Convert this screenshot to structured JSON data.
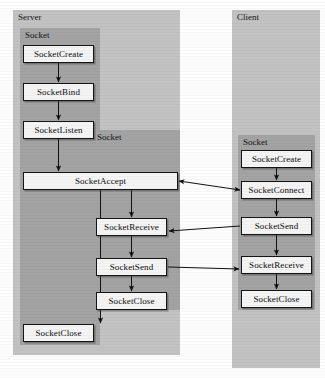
{
  "diagram": {
    "colors": {
      "outer_panel": "#c2c2c2",
      "inner_panel": "#a3a3a3",
      "node_fill": "#f4f4f4",
      "node_border": "#151515",
      "background": "#fdfdfd"
    },
    "panels": [
      {
        "id": "server",
        "label": "Server",
        "x": 13,
        "y": 10,
        "w": 167,
        "h": 345,
        "kind": "outer"
      },
      {
        "id": "server-socket-1",
        "label": "Socket",
        "x": 20,
        "y": 28,
        "w": 80,
        "h": 317,
        "kind": "inner"
      },
      {
        "id": "server-socket-2",
        "label": "Socket",
        "x": 92,
        "y": 130,
        "w": 88,
        "h": 180,
        "kind": "inner"
      },
      {
        "id": "client",
        "label": "Client",
        "x": 232,
        "y": 10,
        "w": 88,
        "h": 358,
        "kind": "outer"
      },
      {
        "id": "client-socket",
        "label": "Socket",
        "x": 238,
        "y": 135,
        "w": 77,
        "h": 175,
        "kind": "inner"
      }
    ],
    "nodes": [
      {
        "id": "srv-create",
        "label": "SocketCreate",
        "x": 23,
        "y": 45,
        "w": 71,
        "group": "server-socket-1"
      },
      {
        "id": "srv-bind",
        "label": "SocketBind",
        "x": 23,
        "y": 83,
        "w": 71,
        "group": "server-socket-1"
      },
      {
        "id": "srv-listen",
        "label": "SocketListen",
        "x": 23,
        "y": 121,
        "w": 71,
        "group": "server-socket-1"
      },
      {
        "id": "srv-accept",
        "label": "SocketAccept",
        "x": 23,
        "y": 172,
        "w": 155,
        "group": "server"
      },
      {
        "id": "srv-receive",
        "label": "SocketReceive",
        "x": 96,
        "y": 218,
        "w": 71,
        "group": "server-socket-2"
      },
      {
        "id": "srv-send",
        "label": "SocketSend",
        "x": 96,
        "y": 258,
        "w": 71,
        "group": "server-socket-2"
      },
      {
        "id": "srv-close-2",
        "label": "SocketClose",
        "x": 96,
        "y": 292,
        "w": 71,
        "group": "server-socket-2"
      },
      {
        "id": "srv-close-1",
        "label": "SocketClose",
        "x": 23,
        "y": 324,
        "w": 71,
        "group": "server-socket-1"
      },
      {
        "id": "cli-create",
        "label": "SocketCreate",
        "x": 241,
        "y": 150,
        "w": 71,
        "group": "client-socket"
      },
      {
        "id": "cli-connect",
        "label": "SocketConnect",
        "x": 241,
        "y": 181,
        "w": 71,
        "group": "client-socket"
      },
      {
        "id": "cli-send",
        "label": "SocketSend",
        "x": 241,
        "y": 217,
        "w": 71,
        "group": "client-socket"
      },
      {
        "id": "cli-receive",
        "label": "SocketReceive",
        "x": 241,
        "y": 256,
        "w": 71,
        "group": "client-socket"
      },
      {
        "id": "cli-close",
        "label": "SocketClose",
        "x": 241,
        "y": 290,
        "w": 71,
        "group": "client-socket"
      }
    ],
    "arrows": [
      {
        "id": "a-create-bind",
        "from": "srv-create",
        "to": "srv-bind",
        "kind": "vertical",
        "heads": "end"
      },
      {
        "id": "a-bind-listen",
        "from": "srv-bind",
        "to": "srv-listen",
        "kind": "vertical",
        "heads": "end"
      },
      {
        "id": "a-listen-accept",
        "from": "srv-listen",
        "to": "srv-accept",
        "kind": "vertical",
        "heads": "end"
      },
      {
        "id": "a-accept-receive",
        "from": "srv-accept",
        "to": "srv-receive",
        "kind": "vertical",
        "heads": "end"
      },
      {
        "id": "a-receive-send",
        "from": "srv-receive",
        "to": "srv-send",
        "kind": "vertical",
        "heads": "end"
      },
      {
        "id": "a-send-close",
        "from": "srv-send",
        "to": "srv-close-2",
        "kind": "vertical",
        "heads": "end"
      },
      {
        "id": "a-accept-close",
        "from": "srv-accept",
        "to": "srv-close-1",
        "kind": "vertical",
        "heads": "end"
      },
      {
        "id": "a-cli-create-connect",
        "from": "cli-create",
        "to": "cli-connect",
        "kind": "vertical",
        "heads": "end"
      },
      {
        "id": "a-cli-connect-send",
        "from": "cli-connect",
        "to": "cli-send",
        "kind": "vertical",
        "heads": "end"
      },
      {
        "id": "a-cli-send-receive",
        "from": "cli-send",
        "to": "cli-receive",
        "kind": "vertical",
        "heads": "end"
      },
      {
        "id": "a-cli-receive-close",
        "from": "cli-receive",
        "to": "cli-close",
        "kind": "vertical",
        "heads": "end"
      },
      {
        "id": "a-accept-connect",
        "from": "srv-accept",
        "to": "cli-connect",
        "kind": "horizontal",
        "heads": "both"
      },
      {
        "id": "a-clisend-srvrecv",
        "from": "cli-send",
        "to": "srv-receive",
        "kind": "diagonal",
        "heads": "end"
      },
      {
        "id": "a-srvsend-clirecv",
        "from": "srv-send",
        "to": "cli-receive",
        "kind": "diagonal",
        "heads": "end"
      }
    ]
  }
}
